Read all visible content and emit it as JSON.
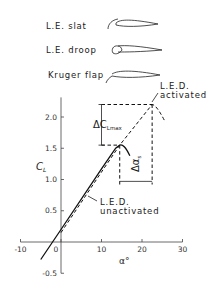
{
  "legend_devices": [
    {
      "label": "L.E. slat",
      "icon": "airfoil-with-slat"
    },
    {
      "label": "L.E. droop",
      "icon": "airfoil-with-droop-nose"
    },
    {
      "label": "Kruger flap",
      "icon": "airfoil-with-kruger-flap"
    }
  ],
  "annotations": {
    "activated_line1": "L.E.D.",
    "activated_line2": "activated",
    "unactivated_line1": "L.E.D.",
    "unactivated_line2": "unactivated",
    "delta_clmax": "ΔC",
    "delta_clmax_sub": "Lmax",
    "delta_alpha": "Δα",
    "delta_alpha_sub": "s"
  },
  "chart_data": {
    "type": "line",
    "title": "",
    "xlabel": "α°",
    "ylabel": "C_L",
    "xlim": [
      -10,
      30
    ],
    "ylim": [
      -0.5,
      2.25
    ],
    "x_ticks": [
      -10,
      0,
      10,
      20,
      30
    ],
    "x_tick_labels": [
      "-10",
      "0",
      "10",
      "20",
      "30"
    ],
    "y_ticks": [
      -0.5,
      0.5,
      1.0,
      1.5,
      2.0
    ],
    "y_tick_labels": [
      "-0.5",
      "0.5",
      "1.0",
      "1.5",
      "2.0"
    ],
    "grid": false,
    "series": [
      {
        "name": "L.E.D. unactivated",
        "style": "solid",
        "points": [
          [
            -5,
            -0.28
          ],
          [
            0,
            0.2
          ],
          [
            10,
            1.17
          ],
          [
            13.5,
            1.5
          ],
          [
            14.5,
            1.55
          ],
          [
            15.5,
            1.52
          ],
          [
            17,
            1.38
          ]
        ]
      },
      {
        "name": "L.E.D. activated",
        "style": "dashed",
        "points": [
          [
            0,
            0.15
          ],
          [
            10,
            1.12
          ],
          [
            14.5,
            1.55
          ],
          [
            22.5,
            2.2
          ],
          [
            23.5,
            2.15
          ],
          [
            25.5,
            1.95
          ]
        ]
      }
    ],
    "deltas": {
      "delta_CLmax": [
        1.55,
        2.2
      ],
      "delta_alpha_s": [
        14.5,
        22.5
      ]
    }
  }
}
